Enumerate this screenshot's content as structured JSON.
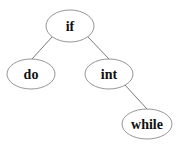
{
  "diagram": {
    "type": "tree",
    "nodes": [
      {
        "id": "if",
        "label": "if",
        "cx": 70,
        "cy": 26,
        "rx": 24,
        "ry": 16
      },
      {
        "id": "do",
        "label": "do",
        "cx": 31,
        "cy": 74,
        "rx": 24,
        "ry": 15
      },
      {
        "id": "int",
        "label": "int",
        "cx": 109,
        "cy": 74,
        "rx": 24,
        "ry": 15
      },
      {
        "id": "while",
        "label": "while",
        "cx": 147,
        "cy": 124,
        "rx": 25,
        "ry": 15
      }
    ],
    "edges": [
      {
        "from": "if",
        "to": "do"
      },
      {
        "from": "if",
        "to": "int"
      },
      {
        "from": "int",
        "to": "while"
      }
    ]
  }
}
